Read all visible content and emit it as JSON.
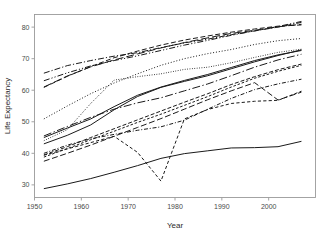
{
  "chart_data": {
    "type": "line",
    "title": "",
    "xlabel": "Year",
    "ylabel": "Life Expectancy",
    "xlim": [
      1950,
      2010
    ],
    "ylim": [
      26,
      84
    ],
    "grid": false,
    "legend": "none",
    "xticks": [
      1950,
      1960,
      1970,
      1980,
      1990,
      2000
    ],
    "yticks": [
      30,
      40,
      50,
      60,
      70,
      80
    ],
    "x": [
      1952,
      1957,
      1962,
      1967,
      1972,
      1977,
      1982,
      1987,
      1992,
      1997,
      2002,
      2007
    ],
    "series": [
      {
        "name": "series-1",
        "linestyle": "dashdot",
        "values": [
          65.4,
          67.8,
          69.4,
          70.8,
          71.9,
          73.5,
          75.0,
          76.2,
          77.6,
          78.8,
          80.0,
          81.5
        ]
      },
      {
        "name": "series-2",
        "linestyle": "dashdotdot",
        "values": [
          63.0,
          65.5,
          67.7,
          69.4,
          70.9,
          72.6,
          74.3,
          75.8,
          77.4,
          78.8,
          80.2,
          81.8
        ]
      },
      {
        "name": "series-3",
        "linestyle": "longdash",
        "values": [
          61.0,
          64.5,
          67.4,
          69.6,
          71.5,
          73.4,
          75.1,
          76.6,
          78.0,
          79.0,
          80.1,
          80.9
        ]
      },
      {
        "name": "series-4",
        "linestyle": "dashed",
        "values": [
          60.9,
          64.4,
          67.5,
          70.3,
          72.4,
          74.3,
          75.9,
          77.2,
          78.4,
          79.4,
          80.3,
          80.7
        ]
      },
      {
        "name": "series-5",
        "linestyle": "dotted",
        "values": [
          50.9,
          55.0,
          58.9,
          62.3,
          65.2,
          67.9,
          70.0,
          71.6,
          72.9,
          74.5,
          75.7,
          76.4
        ]
      },
      {
        "name": "series-6",
        "linestyle": "dotted-fine",
        "values": [
          44.0,
          47.5,
          55.8,
          63.2,
          64.3,
          65.2,
          66.6,
          67.3,
          68.7,
          70.4,
          72.0,
          73.0
        ]
      },
      {
        "name": "series-7",
        "linestyle": "solid",
        "values": [
          43.0,
          45.7,
          49.0,
          53.8,
          58.0,
          60.9,
          62.8,
          64.6,
          66.8,
          69.0,
          71.0,
          72.8
        ]
      },
      {
        "name": "series-8",
        "linestyle": "solid-thin",
        "values": [
          45.0,
          48.0,
          50.9,
          54.8,
          58.4,
          61.0,
          63.1,
          65.0,
          67.2,
          69.4,
          71.2,
          72.6
        ]
      },
      {
        "name": "series-9",
        "linestyle": "dashdot-long",
        "values": [
          45.5,
          48.5,
          51.4,
          54.0,
          56.0,
          57.6,
          59.8,
          62.0,
          64.6,
          67.3,
          69.6,
          71.4
        ]
      },
      {
        "name": "series-10",
        "linestyle": "dashed-med",
        "values": [
          39.5,
          42.1,
          45.0,
          47.8,
          50.6,
          53.4,
          56.2,
          58.9,
          61.8,
          64.3,
          66.5,
          68.3
        ]
      },
      {
        "name": "series-11",
        "linestyle": "dashed-short",
        "values": [
          38.8,
          41.5,
          44.3,
          47.0,
          49.8,
          52.4,
          55.2,
          58.0,
          61.0,
          63.8,
          66.0,
          67.9
        ]
      },
      {
        "name": "series-12",
        "linestyle": "dashdot-fine",
        "values": [
          40.0,
          42.6,
          44.6,
          46.0,
          47.3,
          48.4,
          50.5,
          54.0,
          57.4,
          60.2,
          62.0,
          63.5
        ]
      },
      {
        "name": "series-13",
        "linestyle": "dashed-wide",
        "values": [
          37.5,
          40.0,
          42.6,
          45.4,
          48.2,
          51.0,
          54.0,
          57.0,
          59.8,
          62.4,
          56.9,
          59.4
        ]
      },
      {
        "name": "series-14",
        "linestyle": "dashed-v",
        "values": [
          39.4,
          41.4,
          43.4,
          45.4,
          40.3,
          31.2,
          50.9,
          53.9,
          55.8,
          56.5,
          56.8,
          59.7
        ]
      },
      {
        "name": "series-15",
        "linestyle": "solid-bold",
        "values": [
          28.8,
          30.3,
          32.0,
          34.0,
          36.1,
          38.4,
          39.9,
          40.8,
          41.7,
          41.8,
          42.1,
          43.8
        ]
      }
    ]
  }
}
